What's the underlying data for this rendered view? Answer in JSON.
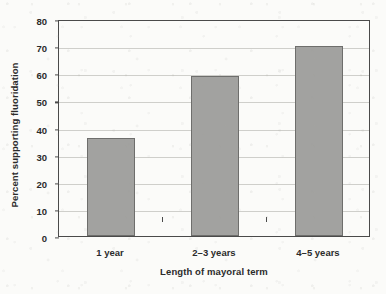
{
  "chart_data": {
    "type": "bar",
    "title": "",
    "subtitle": "",
    "xlabel": "Length of mayoral term",
    "ylabel": "Percent supporting fluoridation",
    "categories": [
      "1 year",
      "2–3 years",
      "4–5 years"
    ],
    "values": [
      36,
      59,
      70
    ],
    "ylim": [
      0,
      80
    ],
    "ytick_step": 10,
    "yticks": [
      0,
      10,
      20,
      30,
      40,
      50,
      60,
      70,
      80
    ],
    "ytick_labels": [
      "0",
      "10",
      "20",
      "30",
      "40",
      "50",
      "60",
      "70",
      "80"
    ],
    "grid": true,
    "grid_axis": "y",
    "legend": false,
    "legend_position": "none",
    "series": [
      {
        "name": "Percent supporting fluoridation",
        "values": [
          36,
          59,
          70
        ]
      }
    ],
    "annotations": [],
    "colors": {
      "bar_fill": "#a2a2a0",
      "bar_border": "#6e6e6c",
      "axis": "#4a4a4a",
      "gridline": "#cfcfcb",
      "text": "#2b2b2b",
      "background": "#fbfbf9"
    }
  }
}
